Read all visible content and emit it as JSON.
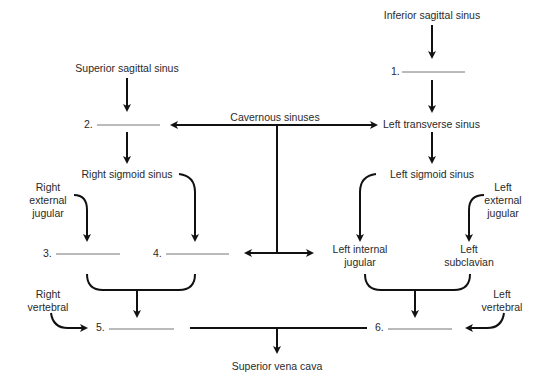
{
  "diagram": {
    "title": "",
    "nodes": {
      "inferior_sagittal": "Inferior sagittal sinus",
      "superior_sagittal": "Superior sagittal sinus",
      "cavernous": "Cavernous sinuses",
      "left_transverse": "Left transverse sinus",
      "right_sigmoid": "Right sigmoid sinus",
      "left_sigmoid": "Left sigmoid sinus",
      "right_external_jugular": [
        "Right",
        "external",
        "jugular"
      ],
      "left_external_jugular": [
        "Left",
        "external",
        "jugular"
      ],
      "left_internal_jugular": [
        "Left internal",
        "jugular"
      ],
      "left_subclavian": [
        "Left",
        "subclavian"
      ],
      "right_vertebral": [
        "Right",
        "vertebral"
      ],
      "left_vertebral": [
        "Left",
        "vertebral"
      ],
      "superior_vena_cava": "Superior vena cava"
    },
    "blanks": {
      "b1": "1.",
      "b2": "2.",
      "b3": "3.",
      "b4": "4.",
      "b5": "5.",
      "b6": "6."
    }
  }
}
